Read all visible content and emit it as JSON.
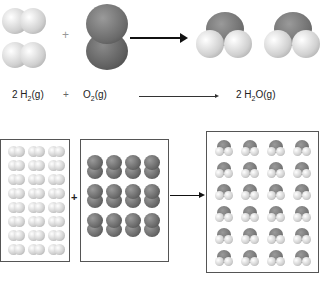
{
  "equation": {
    "reactant1": {
      "coef": "2 ",
      "formula": "H",
      "sub": "2",
      "state": "(g)"
    },
    "plus": "+",
    "reactant2": {
      "formula": "O",
      "sub": "2",
      "state": "(g)"
    },
    "product": {
      "coef": "2 ",
      "formula": "H",
      "sub": "2",
      "rest": "O(g)"
    }
  },
  "diagram": {
    "plus_sign": "+",
    "h2_grid": {
      "cols": 3,
      "rows": 8,
      "count": 24
    },
    "o2_grid": {
      "cols": 4,
      "rows": 3,
      "count": 12
    },
    "h2o_grid": {
      "cols": 4,
      "rows": 6,
      "count": 24
    }
  },
  "colors": {
    "hydrogen": "#d9d9d9",
    "oxygen": "#707070",
    "border": "#555555"
  }
}
